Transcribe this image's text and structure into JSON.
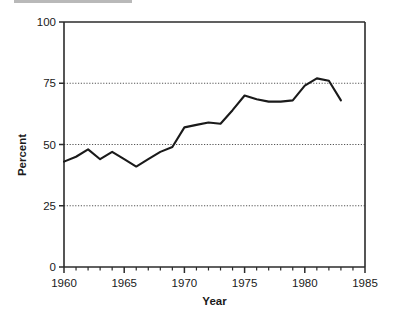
{
  "chart_data": {
    "type": "line",
    "title": "",
    "xlabel": "Year",
    "ylabel": "Percent",
    "xlim": [
      1960,
      1985
    ],
    "ylim": [
      0,
      100
    ],
    "xticks": [
      1960,
      1965,
      1970,
      1975,
      1980,
      1985
    ],
    "xtick_labels": [
      "1960",
      "1965",
      "1970",
      "1975",
      "1980",
      "1985"
    ],
    "yticks": [
      0,
      25,
      50,
      75,
      100
    ],
    "ytick_labels": [
      "0",
      "25",
      "50",
      "75",
      "100"
    ],
    "minor_xtick_interval": 1,
    "grid": "horizontal-dotted-at-25-50-75",
    "legend": "none",
    "series": [
      {
        "name": "Percent",
        "color": "#1a1a1a",
        "x": [
          1960,
          1961,
          1962,
          1963,
          1964,
          1965,
          1966,
          1967,
          1968,
          1969,
          1970,
          1971,
          1972,
          1973,
          1974,
          1975,
          1976,
          1977,
          1978,
          1979,
          1980,
          1981,
          1982,
          1983
        ],
        "values": [
          43,
          45,
          48,
          44,
          47,
          44,
          41,
          44,
          47,
          49,
          57,
          58,
          59,
          58.5,
          64,
          70,
          68.5,
          67.5,
          67.5,
          68,
          74,
          77,
          76,
          68
        ]
      }
    ]
  },
  "axes": {
    "y_label": "Percent",
    "x_label": "Year"
  }
}
